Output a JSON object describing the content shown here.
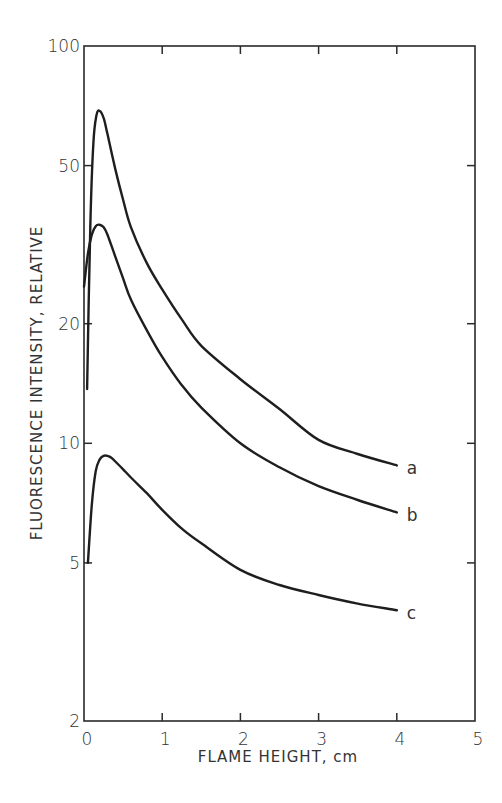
{
  "chart_data": {
    "type": "line",
    "title": "",
    "xlabel": "FLAME HEIGHT, cm",
    "ylabel": "FLUORESCENCE INTENSITY, RELATIVE",
    "xscale": "linear",
    "yscale": "log",
    "xlim": [
      0,
      5
    ],
    "ylim": [
      2,
      100
    ],
    "x_ticks": [
      0,
      1,
      2,
      3,
      4,
      5
    ],
    "x_tick_labels": [
      "0",
      "1",
      "2",
      "3",
      "4",
      "5"
    ],
    "y_ticks": [
      2,
      5,
      10,
      20,
      50,
      100
    ],
    "y_tick_labels": [
      "2",
      "5",
      "10",
      "20",
      "50",
      "100"
    ],
    "grid": false,
    "legend": "inline labels at right end of each curve",
    "series": [
      {
        "name": "a",
        "x": [
          0.04,
          0.08,
          0.12,
          0.16,
          0.2,
          0.25,
          0.3,
          0.4,
          0.5,
          0.6,
          0.8,
          1.0,
          1.25,
          1.5,
          2.0,
          2.5,
          3.0,
          3.5,
          4.0
        ],
        "values": [
          13.7,
          35,
          57,
          67,
          68.7,
          66,
          60,
          49,
          41,
          35,
          28.5,
          24.4,
          20.5,
          17.6,
          14.5,
          12.2,
          10.2,
          9.4,
          8.8
        ]
      },
      {
        "name": "b",
        "x": [
          0.0,
          0.05,
          0.1,
          0.15,
          0.2,
          0.25,
          0.3,
          0.4,
          0.5,
          0.6,
          0.8,
          1.0,
          1.25,
          1.5,
          2.0,
          2.5,
          3.0,
          3.5,
          4.0
        ],
        "values": [
          24.8,
          30,
          33.5,
          35.2,
          35.5,
          35,
          33.5,
          29.5,
          26,
          23,
          19.3,
          16.5,
          14,
          12.3,
          10.0,
          8.7,
          7.8,
          7.2,
          6.7
        ]
      },
      {
        "name": "c",
        "x": [
          0.05,
          0.1,
          0.15,
          0.2,
          0.25,
          0.3,
          0.35,
          0.4,
          0.5,
          0.6,
          0.8,
          1.0,
          1.25,
          1.5,
          2.0,
          2.5,
          3.0,
          3.5,
          4.0
        ],
        "values": [
          5.0,
          7.0,
          8.5,
          9.1,
          9.3,
          9.3,
          9.2,
          9.0,
          8.6,
          8.2,
          7.5,
          6.8,
          6.1,
          5.6,
          4.8,
          4.4,
          4.15,
          3.95,
          3.8
        ]
      }
    ]
  }
}
